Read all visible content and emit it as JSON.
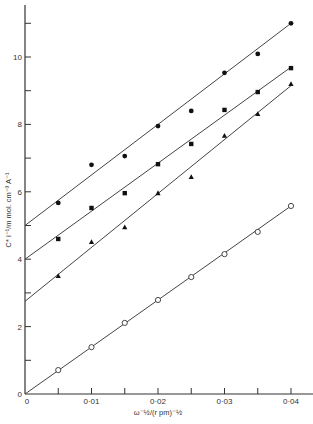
{
  "chart_data": {
    "type": "scatter",
    "title": "",
    "xlabel": "ω⁻½/(r pm)⁻½",
    "ylabel": "C* i⁻¹/m mol. cm⁻³ A⁻¹",
    "xlim": [
      0,
      0.042
    ],
    "ylim": [
      0,
      11.6
    ],
    "grid": false,
    "legend": "none",
    "x_ticks": [
      0,
      0.005,
      0.01,
      0.015,
      0.02,
      0.025,
      0.03,
      0.035,
      0.04
    ],
    "x_tick_labels": [
      {
        "value": 0,
        "label": "0"
      },
      {
        "value": 0.01,
        "label": "0·01"
      },
      {
        "value": 0.02,
        "label": "0·02"
      },
      {
        "value": 0.03,
        "label": "0·03"
      },
      {
        "value": 0.04,
        "label": "0·04"
      }
    ],
    "y_ticks": [
      0,
      1,
      2,
      3,
      4,
      5,
      6,
      7,
      8,
      9,
      10,
      11
    ],
    "y_tick_labels": [
      {
        "value": 0,
        "label": "0"
      },
      {
        "value": 2,
        "label": "2"
      },
      {
        "value": 4,
        "label": "4"
      },
      {
        "value": 6,
        "label": "6"
      },
      {
        "value": 8,
        "label": "8"
      },
      {
        "value": 10,
        "label": "10"
      }
    ],
    "series": [
      {
        "name": "filled-circles",
        "marker": "filled-circle",
        "x": [
          0.005,
          0.01,
          0.015,
          0.02,
          0.025,
          0.03,
          0.035,
          0.04
        ],
        "y": [
          5.67,
          6.8,
          7.06,
          7.95,
          8.4,
          9.53,
          10.09,
          11.0
        ],
        "fit_line": {
          "x": [
            0,
            0.04
          ],
          "y": [
            5.0,
            11.0
          ]
        }
      },
      {
        "name": "filled-squares",
        "marker": "filled-square",
        "x": [
          0.005,
          0.01,
          0.015,
          0.02,
          0.025,
          0.03,
          0.035,
          0.04
        ],
        "y": [
          4.6,
          5.52,
          5.96,
          6.82,
          7.42,
          8.43,
          8.96,
          9.67
        ],
        "fit_line": {
          "x": [
            0,
            0.04
          ],
          "y": [
            4.0,
            9.7
          ]
        }
      },
      {
        "name": "filled-triangles",
        "marker": "filled-triangle",
        "x": [
          0.005,
          0.01,
          0.015,
          0.02,
          0.025,
          0.03,
          0.035,
          0.04
        ],
        "y": [
          3.5,
          4.51,
          4.95,
          5.96,
          6.44,
          7.66,
          8.31,
          9.2
        ],
        "fit_line": {
          "x": [
            0,
            0.04
          ],
          "y": [
            2.75,
            9.15
          ]
        }
      },
      {
        "name": "open-circles",
        "marker": "open-circle",
        "x": [
          0,
          0.005,
          0.01,
          0.015,
          0.02,
          0.025,
          0.03,
          0.035,
          0.04
        ],
        "y": [
          0,
          0.71,
          1.39,
          2.11,
          2.79,
          3.47,
          4.15,
          4.81,
          5.58
        ],
        "fit_line": {
          "x": [
            0,
            0.04
          ],
          "y": [
            0,
            5.58
          ]
        }
      }
    ]
  }
}
